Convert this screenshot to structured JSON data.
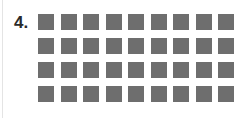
{
  "problem": {
    "number_label": "4.",
    "rows": 4,
    "columns": 9,
    "total_squares": 36,
    "square_color": "#6e6e6e"
  }
}
